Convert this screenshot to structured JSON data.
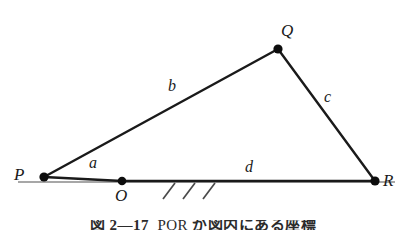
{
  "figure": {
    "type": "geometry-diagram",
    "background_color": "#ffffff",
    "stroke_color": "#1a1a1a",
    "ground_color": "#8a8a8a"
  },
  "vertices": [
    {
      "id": "P",
      "label": "P",
      "x": 44,
      "y": 177,
      "label_x": 14,
      "label_y": 166,
      "dot": true
    },
    {
      "id": "O",
      "label": "O",
      "x": 122,
      "y": 181,
      "label_x": 115,
      "label_y": 187,
      "dot": true
    },
    {
      "id": "Q",
      "label": "Q",
      "x": 278,
      "y": 49,
      "label_x": 281,
      "label_y": 22,
      "dot": true
    },
    {
      "id": "R",
      "label": "R",
      "x": 375,
      "y": 181,
      "label_x": 383,
      "label_y": 172,
      "dot": true
    }
  ],
  "segments": [
    {
      "id": "a",
      "label": "a",
      "from": "P",
      "to": "O",
      "label_x": 89,
      "label_y": 155,
      "width": 2.4
    },
    {
      "id": "b",
      "label": "b",
      "from": "P",
      "to": "Q",
      "label_x": 168,
      "label_y": 78,
      "width": 2.4
    },
    {
      "id": "c",
      "label": "c",
      "from": "Q",
      "to": "R",
      "label_x": 324,
      "label_y": 89,
      "width": 2.4
    },
    {
      "id": "d",
      "label": "d",
      "from": "O",
      "to": "R",
      "label_x": 245,
      "label_y": 159,
      "width": 2.4
    }
  ],
  "ground_line": {
    "x1": 18,
    "x2": 395,
    "y": 182,
    "width": 1.6
  },
  "hatching": {
    "count": 3,
    "start_x": 163,
    "spacing": 20,
    "length": 16,
    "slant_dx": 12,
    "y": 183,
    "width": 1.6
  },
  "caption": {
    "prefix": "図",
    "number": "2—17",
    "overlined": "PQR",
    "suffix": "が図内にある座標"
  }
}
